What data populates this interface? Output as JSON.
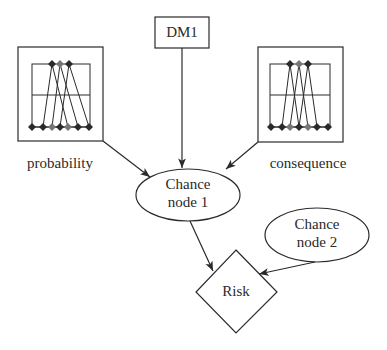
{
  "diagram": {
    "type": "influence-diagram",
    "colors": {
      "stroke": "#2a2a2a",
      "marker_dark": "#2a2a2a",
      "marker_mid": "#777777",
      "background": "#ffffff"
    },
    "nodes": {
      "dm1": {
        "label": "DM1",
        "shape": "rectangle"
      },
      "chance1": {
        "line1": "Chance",
        "line2": "node 1",
        "shape": "ellipse"
      },
      "chance2": {
        "line1": "Chance",
        "line2": "node 2",
        "shape": "ellipse"
      },
      "risk": {
        "label": "Risk",
        "shape": "diamond"
      },
      "probability": {
        "label": "probability",
        "shape": "distribution-box"
      },
      "consequence": {
        "label": "consequence",
        "shape": "distribution-box"
      }
    },
    "edges": [
      {
        "from": "probability",
        "to": "chance1"
      },
      {
        "from": "dm1",
        "to": "chance1"
      },
      {
        "from": "consequence",
        "to": "chance1"
      },
      {
        "from": "chance1",
        "to": "risk"
      },
      {
        "from": "chance2",
        "to": "risk"
      }
    ]
  }
}
